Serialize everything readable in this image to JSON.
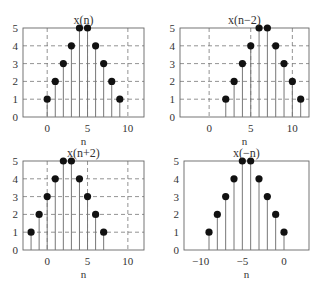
{
  "figure": {
    "background": "#ffffff",
    "axis_color": "#666666",
    "grid_color": "#777777",
    "stem_color": "#777777",
    "marker_color": "#111111"
  },
  "chart_data": [
    {
      "type": "stem",
      "title": "x(n)",
      "xlabel": "n",
      "ylabel": "",
      "x": [
        0,
        1,
        2,
        3,
        4,
        5,
        6,
        7,
        8,
        9
      ],
      "values": [
        1,
        2,
        3,
        4,
        5,
        5,
        4,
        3,
        2,
        1
      ],
      "xlim": [
        -3,
        12
      ],
      "ylim": [
        0,
        5
      ],
      "xticks": [
        0,
        5,
        10
      ],
      "yticks": [
        0,
        1,
        2,
        3,
        4,
        5
      ],
      "grid": true,
      "box": {
        "left": 23,
        "top": 28,
        "right": 144,
        "bottom": 117
      }
    },
    {
      "type": "stem",
      "title": "x(n−2)",
      "xlabel": "n",
      "ylabel": "",
      "x": [
        2,
        3,
        4,
        5,
        6,
        7,
        8,
        9,
        10,
        11
      ],
      "values": [
        1,
        2,
        3,
        4,
        5,
        5,
        4,
        3,
        2,
        1
      ],
      "xlim": [
        -3.5,
        12
      ],
      "ylim": [
        0,
        5
      ],
      "xticks": [
        0,
        5,
        10
      ],
      "yticks": [
        0,
        1,
        2,
        3,
        4,
        5
      ],
      "grid": true,
      "box": {
        "left": 180,
        "top": 28,
        "right": 309,
        "bottom": 117
      }
    },
    {
      "type": "stem",
      "title": "x(n+2)",
      "xlabel": "n",
      "ylabel": "",
      "x": [
        -2,
        -1,
        0,
        1,
        2,
        3,
        4,
        5,
        6,
        7
      ],
      "values": [
        1,
        2,
        3,
        4,
        5,
        5,
        4,
        3,
        2,
        1
      ],
      "xlim": [
        -3,
        12
      ],
      "ylim": [
        0,
        5
      ],
      "xticks": [
        0,
        5,
        10
      ],
      "yticks": [
        0,
        1,
        2,
        3,
        4,
        5
      ],
      "grid": true,
      "box": {
        "left": 23,
        "top": 161,
        "right": 144,
        "bottom": 250
      }
    },
    {
      "type": "stem",
      "title": "x(−n)",
      "xlabel": "n",
      "ylabel": "",
      "x": [
        -9,
        -8,
        -7,
        -6,
        -5,
        -4,
        -3,
        -2,
        -1,
        0
      ],
      "values": [
        1,
        2,
        3,
        4,
        5,
        5,
        4,
        3,
        2,
        1
      ],
      "xlim": [
        -12,
        3
      ],
      "ylim": [
        0,
        5
      ],
      "xticks": [
        -10,
        -5,
        0
      ],
      "yticks": [
        0,
        1,
        2,
        3,
        4,
        5
      ],
      "grid": false,
      "box": {
        "left": 184,
        "top": 161,
        "right": 309,
        "bottom": 250
      }
    }
  ]
}
